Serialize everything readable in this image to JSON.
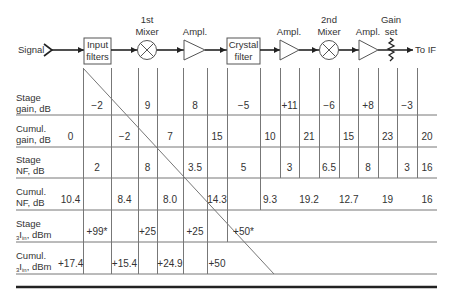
{
  "diagram": {
    "input_label": "Signal",
    "output_label": "To IF",
    "blocks": [
      {
        "name": "Input filters",
        "line1": "Input",
        "line2": "filters",
        "type": "box"
      },
      {
        "name": "1st Mixer",
        "line1": "1st",
        "line2": "Mixer",
        "type": "mixer"
      },
      {
        "name": "Ampl.",
        "line1": "Ampl.",
        "type": "amplifier"
      },
      {
        "name": "Crystal filter",
        "line1": "Crystal",
        "line2": "filter",
        "type": "box"
      },
      {
        "name": "Ampl.",
        "line1": "Ampl.",
        "type": "amplifier"
      },
      {
        "name": "2nd Mixer",
        "line1": "2nd",
        "line2": "Mixer",
        "type": "mixer"
      },
      {
        "name": "Ampl.",
        "line1": "Ampl.",
        "type": "amplifier"
      },
      {
        "name": "Gain set",
        "line1": "Gain",
        "line2": "set",
        "type": "attenuator"
      }
    ]
  },
  "table": {
    "rows": [
      {
        "label1": "Stage",
        "label2": "gain, dB",
        "values": [
          "",
          "−2",
          "",
          "9",
          "",
          "8",
          "",
          "−5",
          "",
          "+11",
          "",
          "−6",
          "",
          "+8",
          "",
          "−3",
          ""
        ]
      },
      {
        "label1": "Cumul.",
        "label2": "gain, dB",
        "values": [
          "0",
          "",
          "−2",
          "",
          "7",
          "",
          "15",
          "",
          "10",
          "",
          "21",
          "",
          "15",
          "",
          "23",
          "",
          "20"
        ]
      },
      {
        "label1": "Stage",
        "label2": "NF, dB",
        "values": [
          "",
          "2",
          "",
          "8",
          "",
          "3.5",
          "",
          "5",
          "",
          "3",
          "",
          "6.5",
          "",
          "8",
          "",
          "3",
          "16"
        ]
      },
      {
        "label1": "Cumul.",
        "label2": "NF, dB",
        "values": [
          "10.4",
          "",
          "8.4",
          "",
          "8.0",
          "",
          "14.3",
          "",
          "9.3",
          "",
          "19.2",
          "",
          "12.7",
          "",
          "19",
          "",
          "16"
        ]
      },
      {
        "label1": "Stage",
        "label2_pre": "3",
        "label2_I": "I",
        "label2_sub": "in",
        "label2_post": ", dBm",
        "values": [
          "",
          "+99*",
          "",
          "+25",
          "",
          "+25",
          "",
          "+50*"
        ]
      },
      {
        "label1": "Cumul.",
        "label2_pre": "3",
        "label2_I": "I",
        "label2_sub": "in",
        "label2_post": ", dBm",
        "values": [
          "+17.4",
          "",
          "+15.4",
          "",
          "+24.9",
          "",
          "+50"
        ]
      }
    ]
  }
}
